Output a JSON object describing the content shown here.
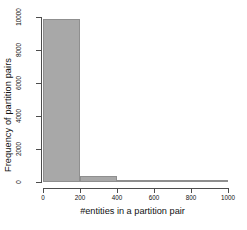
{
  "chart_data": {
    "type": "bar",
    "title": "",
    "subtitle": "",
    "xlabel": "#entities in a partition pair",
    "ylabel": "Frequency of partition pairs",
    "categories": [
      "0-200",
      "200-400",
      "400-600",
      "600-800",
      "800-1000"
    ],
    "bin_edges": [
      0,
      200,
      400,
      600,
      800,
      1000
    ],
    "values": [
      9850,
      370,
      100,
      30,
      20
    ],
    "xlim": [
      0,
      1000
    ],
    "ylim": [
      0,
      10000
    ],
    "xticks": [
      0,
      200,
      400,
      600,
      800,
      1000
    ],
    "xtick_labels": [
      "0",
      "200",
      "400",
      "600",
      "800",
      "1000"
    ],
    "yticks": [
      0,
      2000,
      4000,
      6000,
      8000,
      10000
    ],
    "ytick_labels": [
      "0",
      "2000",
      "4000",
      "6000",
      "8000",
      "10000"
    ],
    "grid": false,
    "legend": false,
    "bar_color": "#a8a8a8",
    "bar_border_color": "#8f8f8f",
    "axis_color": "#4d4d4d",
    "background": "#ffffff"
  }
}
